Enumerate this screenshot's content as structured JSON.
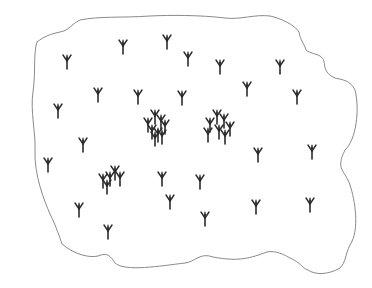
{
  "diagram": {
    "type": "plant-distribution-map",
    "colors": {
      "background": "#ffffff",
      "boundary": "#8a8a8a",
      "symbol": "#2b2b2b"
    },
    "boundary_path": "M33,92 C30,110 36,135 35,150 C34,175 44,200 50,214 C56,226 60,238 62,244 C75,255 90,258 98,256 C108,252 110,256 115,263 C125,272 160,266 185,263 C195,262 200,252 213,257 C240,262 250,258 267,252 C275,250 285,255 290,258 C300,262 302,268 308,270 C315,275 328,275 340,268 C346,262 345,255 350,245 C360,230 355,200 350,185 C345,170 335,170 345,150 C356,140 360,110 355,90 C350,80 343,80 335,78 C318,70 330,60 318,55 C312,53 308,52 306,50 C305,45 300,40 299,32 C295,25 280,18 270,16 C255,14 240,20 225,18 C200,15 170,15 150,16 C120,18 100,16 80,20 C70,25 70,30 60,32 C45,35 40,40 37,42 C33,55 36,70 33,92 Z",
    "symbols": {
      "glyph": "tree-fork",
      "isolated": [
        {
          "x": 67,
          "y": 55
        },
        {
          "x": 123,
          "y": 40
        },
        {
          "x": 167,
          "y": 35
        },
        {
          "x": 188,
          "y": 52
        },
        {
          "x": 220,
          "y": 60
        },
        {
          "x": 280,
          "y": 60
        },
        {
          "x": 247,
          "y": 82
        },
        {
          "x": 297,
          "y": 90
        },
        {
          "x": 182,
          "y": 91
        },
        {
          "x": 138,
          "y": 90
        },
        {
          "x": 98,
          "y": 88
        },
        {
          "x": 58,
          "y": 104
        },
        {
          "x": 83,
          "y": 138
        },
        {
          "x": 48,
          "y": 158
        },
        {
          "x": 258,
          "y": 148
        },
        {
          "x": 312,
          "y": 145
        },
        {
          "x": 162,
          "y": 172
        },
        {
          "x": 200,
          "y": 175
        },
        {
          "x": 79,
          "y": 203
        },
        {
          "x": 170,
          "y": 195
        },
        {
          "x": 108,
          "y": 225
        },
        {
          "x": 205,
          "y": 212
        },
        {
          "x": 256,
          "y": 200
        },
        {
          "x": 310,
          "y": 198
        }
      ],
      "clusters": [
        {
          "name": "center-left-cluster",
          "points": [
            {
              "x": 155,
              "y": 110
            },
            {
              "x": 161,
              "y": 115
            },
            {
              "x": 148,
              "y": 118
            },
            {
              "x": 165,
              "y": 120
            },
            {
              "x": 152,
              "y": 125
            },
            {
              "x": 158,
              "y": 128
            },
            {
              "x": 162,
              "y": 130
            },
            {
              "x": 155,
              "y": 132
            }
          ]
        },
        {
          "name": "center-right-cluster",
          "points": [
            {
              "x": 217,
              "y": 110
            },
            {
              "x": 224,
              "y": 114
            },
            {
              "x": 210,
              "y": 118
            },
            {
              "x": 230,
              "y": 122
            },
            {
              "x": 208,
              "y": 128
            },
            {
              "x": 219,
              "y": 125
            },
            {
              "x": 225,
              "y": 130
            }
          ]
        },
        {
          "name": "lower-left-cluster",
          "points": [
            {
              "x": 115,
              "y": 166
            },
            {
              "x": 103,
              "y": 174
            },
            {
              "x": 110,
              "y": 172
            },
            {
              "x": 120,
              "y": 172
            },
            {
              "x": 107,
              "y": 180
            }
          ]
        }
      ]
    }
  }
}
